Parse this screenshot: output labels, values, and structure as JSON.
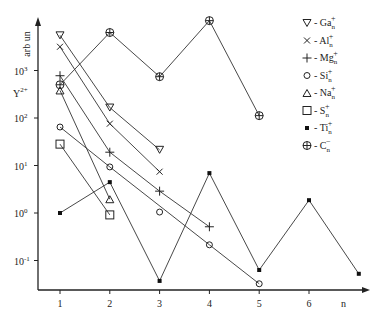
{
  "chart_data": {
    "type": "line",
    "title": "",
    "xlabel": "n",
    "ylabel": "Y2+ arb un",
    "ylabel_parts": {
      "top": "arb un",
      "symbol": "Y",
      "superscript": "2+"
    },
    "yscale": "log",
    "ylim_log10": [
      -1.6,
      4.3
    ],
    "xlim": [
      0.5,
      7.0
    ],
    "x_ticks": [
      "1",
      "2",
      "3",
      "4",
      "5",
      "6"
    ],
    "y_ticks": [
      {
        "label": "10",
        "exp": "3",
        "log": 3
      },
      {
        "label": "10",
        "exp": "2",
        "log": 2
      },
      {
        "label": "10",
        "exp": "1",
        "log": 1
      },
      {
        "label": "10",
        "exp": "0",
        "log": 0
      },
      {
        "label": "10",
        "exp": "-1",
        "log": -1
      }
    ],
    "grid": false,
    "legend_position": "upper right",
    "series": [
      {
        "name": "Ga_n+",
        "base": "Ga",
        "sub": "n",
        "sup": "+",
        "marker": "triangle-down",
        "legend_marker": "▽",
        "x": [
          1,
          2,
          3
        ],
        "log_values": [
          3.74,
          2.22,
          1.33
        ],
        "values": [
          5500,
          166,
          21
        ]
      },
      {
        "name": "Al_n+",
        "base": "Al",
        "sub": "n",
        "sup": "+",
        "marker": "x",
        "legend_marker": "×",
        "x": [
          1,
          2,
          3
        ],
        "log_values": [
          3.5,
          1.88,
          0.87
        ],
        "values": [
          3160,
          76,
          7.4
        ]
      },
      {
        "name": "Mg_n+",
        "base": "Mg",
        "sub": "n",
        "sup": "+",
        "marker": "plus",
        "legend_marker": "+",
        "x": [
          1,
          2,
          3,
          4
        ],
        "log_values": [
          2.89,
          1.28,
          0.46,
          -0.29
        ],
        "values": [
          776,
          19,
          2.9,
          0.51
        ]
      },
      {
        "name": "Si_n+",
        "base": "Si",
        "sub": "n",
        "sup": "+",
        "marker": "circle",
        "legend_marker": "o",
        "x": [
          1,
          2,
          3,
          4,
          5
        ],
        "log_values": [
          1.81,
          0.97,
          0.02,
          -0.67,
          -1.49
        ],
        "values": [
          65,
          9.3,
          1.05,
          0.21,
          0.032
        ],
        "connected": [
          [
            1,
            2
          ],
          [
            2,
            4
          ],
          [
            4,
            5
          ]
        ]
      },
      {
        "name": "Na_n+",
        "base": "Na",
        "sub": "n",
        "sup": "+",
        "marker": "triangle-up",
        "legend_marker": "△",
        "x": [
          1,
          2
        ],
        "log_values": [
          2.58,
          0.29
        ],
        "values": [
          380,
          1.95
        ]
      },
      {
        "name": "S_n+",
        "base": "S",
        "sub": "n",
        "sup": "+",
        "marker": "square",
        "legend_marker": "□",
        "x": [
          1,
          2
        ],
        "log_values": [
          1.45,
          -0.04
        ],
        "values": [
          28,
          0.91
        ]
      },
      {
        "name": "Ti_n+",
        "base": "Ti",
        "sub": "n",
        "sup": "+",
        "marker": "dot",
        "legend_marker": "•",
        "x": [
          1,
          2,
          3,
          4,
          5,
          6,
          7
        ],
        "log_values": [
          0.0,
          0.65,
          -1.43,
          0.84,
          -1.2,
          0.27,
          -1.28
        ],
        "values": [
          1.0,
          4.5,
          0.037,
          6.9,
          0.063,
          1.86,
          0.052
        ]
      },
      {
        "name": "C_n-",
        "base": "C",
        "sub": "n",
        "sup": "−",
        "marker": "circle-plus",
        "legend_marker": "⊕",
        "x": [
          1,
          2,
          3,
          4,
          5
        ],
        "log_values": [
          2.7,
          3.8,
          2.87,
          4.05,
          2.05
        ],
        "values": [
          500,
          6300,
          740,
          11200,
          112
        ]
      }
    ]
  }
}
